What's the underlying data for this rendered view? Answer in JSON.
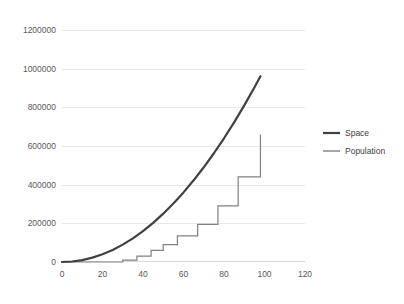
{
  "chart_data": {
    "type": "line",
    "title": "",
    "xlabel": "",
    "ylabel": "",
    "xlim": [
      0,
      120
    ],
    "ylim": [
      0,
      1200000
    ],
    "grid": true,
    "legend_position": "right",
    "y_ticks": [
      "0",
      "200000",
      "400000",
      "600000",
      "800000",
      "1000000",
      "1200000"
    ],
    "y_tick_values": [
      0,
      200000,
      400000,
      600000,
      800000,
      1000000,
      1200000
    ],
    "x_ticks": [
      "0",
      "20",
      "40",
      "60",
      "80",
      "100",
      "120"
    ],
    "x_tick_values": [
      0,
      20,
      40,
      60,
      80,
      100,
      120
    ],
    "series": [
      {
        "name": "Space",
        "color": "#404040",
        "width": 2.2,
        "style": "smooth-curve",
        "x": [
          0,
          5,
          10,
          15,
          20,
          25,
          30,
          35,
          40,
          45,
          50,
          55,
          60,
          65,
          70,
          75,
          80,
          85,
          90,
          95,
          98
        ],
        "values": [
          0,
          2500,
          10000,
          22500,
          40000,
          62500,
          90000,
          122500,
          160000,
          202500,
          250000,
          302500,
          360000,
          422500,
          490000,
          562500,
          640000,
          722500,
          810000,
          902500,
          960400
        ]
      },
      {
        "name": "Population",
        "color": "#808080",
        "width": 1.2,
        "style": "step",
        "x": [
          0,
          10,
          20,
          30,
          37,
          44,
          50,
          57,
          67,
          77,
          87,
          98
        ],
        "values": [
          0,
          0,
          0,
          10000,
          30000,
          60000,
          90000,
          135000,
          195000,
          290000,
          440000,
          660000
        ]
      }
    ],
    "legend_entries": [
      {
        "label": "Space",
        "color": "#404040"
      },
      {
        "label": "Population",
        "color": "#808080"
      }
    ]
  }
}
